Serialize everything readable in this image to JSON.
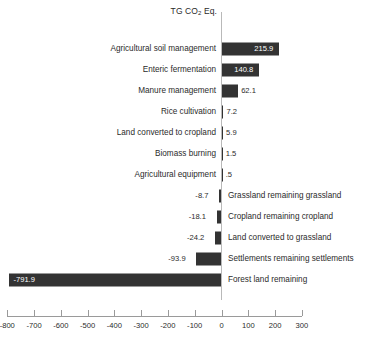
{
  "chart_data": {
    "type": "bar",
    "orientation": "horizontal",
    "title": "TG CO2 Eq.",
    "title_parts": {
      "pre": "TG CO",
      "sub": "2",
      "post": " Eq."
    },
    "xlabel": "",
    "ylabel": "",
    "xlim": [
      -800,
      300
    ],
    "grid": false,
    "legend": null,
    "bar_color": "#333333",
    "axis_color": "#9a9a9a",
    "text_color": "#2b2b2b",
    "xticks": [
      -800,
      -700,
      -600,
      -500,
      -400,
      -300,
      -200,
      -100,
      0,
      100,
      200,
      300
    ],
    "xtick_labels": [
      "-800",
      "-700",
      "-600",
      "-500",
      "-400",
      "-300",
      "-200",
      "-100",
      "0",
      "100",
      "200",
      "300"
    ],
    "categories": [
      "Agricultural soil management",
      "Enteric fermentation",
      "Manure management",
      "Rice cultivation",
      "Land converted to cropland",
      "Biomass burning",
      "Agricultural equipment",
      "Grassland remaining grassland",
      "Cropland remaining cropland",
      "Land converted to grassland",
      "Settlements remaining settlements",
      "Forest land remaining"
    ],
    "values": [
      215.9,
      140.8,
      62.1,
      7.2,
      5.9,
      1.5,
      0.5,
      -8.7,
      -18.1,
      -24.2,
      -93.9,
      -791.9
    ],
    "value_labels": [
      "215.9",
      "140.8",
      "62.1",
      "7.2",
      "5.9",
      "1.5",
      ".5",
      "-8.7",
      "-18.1",
      "-24.2",
      "-93.9",
      "-791.9"
    ]
  }
}
